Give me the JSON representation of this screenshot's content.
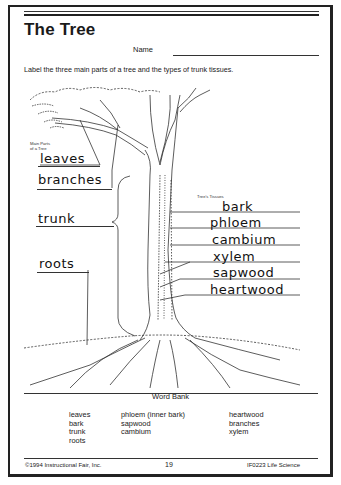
{
  "worksheet": {
    "title": "The Tree",
    "name_label": "Name",
    "instructions": "Label the three main parts of a tree and the types of trunk tissues."
  },
  "main_parts": {
    "caption_line1": "Main Parts",
    "caption_line2": "of a Tree",
    "answers": [
      "leaves",
      "branches",
      "trunk",
      "roots"
    ]
  },
  "trunk_tissues": {
    "caption": "Tree's Tissues",
    "answers": [
      "bark",
      "phloem",
      "cambium",
      "xylem",
      "sapwood",
      "heartwood"
    ]
  },
  "word_bank": {
    "title": "Word Bank",
    "columns": [
      [
        "leaves",
        "bark",
        "trunk",
        "roots"
      ],
      [
        "phloem (inner bark)",
        "sapwood",
        "cambium"
      ],
      [
        "heartwood",
        "branches",
        "xylem"
      ]
    ]
  },
  "footer": {
    "copyright": "©1994 Instructional Fair, Inc.",
    "page_number": "19",
    "series": "IF0223 Life Science"
  }
}
